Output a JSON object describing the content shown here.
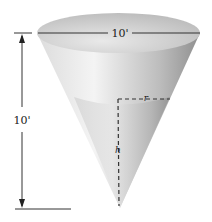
{
  "figure": {
    "top_diameter_label": "10'",
    "height_label": "10'",
    "water_radius_label": "r",
    "water_height_label": "h",
    "colors": {
      "rim_top": "#bdbdbd",
      "cone_light": "#f2f2f2",
      "cone_shade": "#9a9a9a",
      "water": "#c8c8c8",
      "line": "#222222"
    }
  }
}
